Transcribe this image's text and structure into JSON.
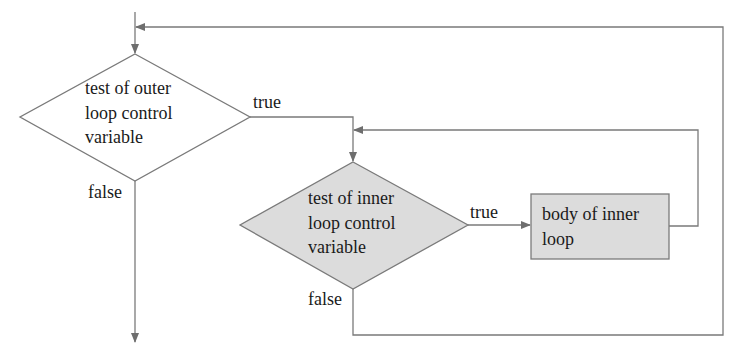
{
  "diagram": {
    "type": "flowchart",
    "colors": {
      "stroke": "#7a7a7a",
      "shaded_fill": "#dcdcdc",
      "background": "#ffffff",
      "text": "#1a1a1a"
    },
    "nodes": {
      "outer_test": {
        "shape": "diamond",
        "lines": [
          "test of outer",
          "loop control",
          "variable"
        ]
      },
      "inner_test": {
        "shape": "diamond",
        "shaded": true,
        "lines": [
          "test of inner",
          "loop control",
          "variable"
        ]
      },
      "inner_body": {
        "shape": "rectangle",
        "shaded": true,
        "lines": [
          "body of inner",
          "loop"
        ]
      }
    },
    "edge_labels": {
      "outer_true": "true",
      "outer_false": "false",
      "inner_true": "true",
      "inner_false": "false"
    }
  }
}
